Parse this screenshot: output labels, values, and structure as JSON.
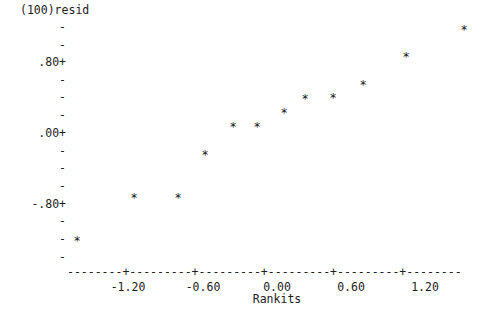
{
  "chart_data": {
    "type": "scatter",
    "title": "(100)resid",
    "xlabel": "Rankits",
    "ylabel": "(100)resid",
    "xlim": [
      -1.85,
      1.65
    ],
    "ylim": [
      -1.42,
      1.29
    ],
    "grid": false,
    "legend": null,
    "x_ticks": [
      {
        "value": -1.2,
        "label": "-1.20",
        "px": 128
      },
      {
        "value": -0.6,
        "label": "-0.60",
        "px": 203
      },
      {
        "value": 0.0,
        "label": "0.00",
        "px": 277
      },
      {
        "value": 0.6,
        "label": "0.60",
        "px": 351
      },
      {
        "value": 1.2,
        "label": "1.20",
        "px": 425
      }
    ],
    "y_ticks": [
      {
        "value": 0.8,
        "label": ".80+",
        "px": 62
      },
      {
        "value": 0.0,
        "label": ".00+",
        "px": 133
      },
      {
        "value": -0.8,
        "label": "-.80+",
        "px": 204
      }
    ],
    "y_minor_ticks": [
      {
        "label": "-",
        "px": 27
      },
      {
        "label": "-",
        "px": 45
      },
      {
        "label": "-",
        "px": 80
      },
      {
        "label": "-",
        "px": 97
      },
      {
        "label": "-",
        "px": 115
      },
      {
        "label": "-",
        "px": 151
      },
      {
        "label": "-",
        "px": 168
      },
      {
        "label": "-",
        "px": 186
      },
      {
        "label": "-",
        "px": 221
      },
      {
        "label": "-",
        "px": 239
      },
      {
        "label": "-",
        "px": 257
      }
    ],
    "x_axis_line": "--------+---------+---------+---------+---------+--------",
    "point_marker": "*",
    "x": [
      -1.62,
      -1.16,
      -0.8,
      -0.58,
      -0.36,
      -0.16,
      0.06,
      0.23,
      0.45,
      0.7,
      1.05,
      1.52
    ],
    "y": [
      -1.24,
      -0.76,
      -0.76,
      -0.27,
      0.05,
      0.05,
      0.2,
      0.36,
      0.37,
      0.52,
      0.83,
      1.14
    ],
    "points_px": [
      {
        "x": 77,
        "y": 241
      },
      {
        "x": 134,
        "y": 198
      },
      {
        "x": 178,
        "y": 198
      },
      {
        "x": 205,
        "y": 155
      },
      {
        "x": 233,
        "y": 127
      },
      {
        "x": 257,
        "y": 127
      },
      {
        "x": 284,
        "y": 113
      },
      {
        "x": 305,
        "y": 99
      },
      {
        "x": 333,
        "y": 98
      },
      {
        "x": 363,
        "y": 85
      },
      {
        "x": 406,
        "y": 57
      },
      {
        "x": 464,
        "y": 30
      }
    ]
  }
}
